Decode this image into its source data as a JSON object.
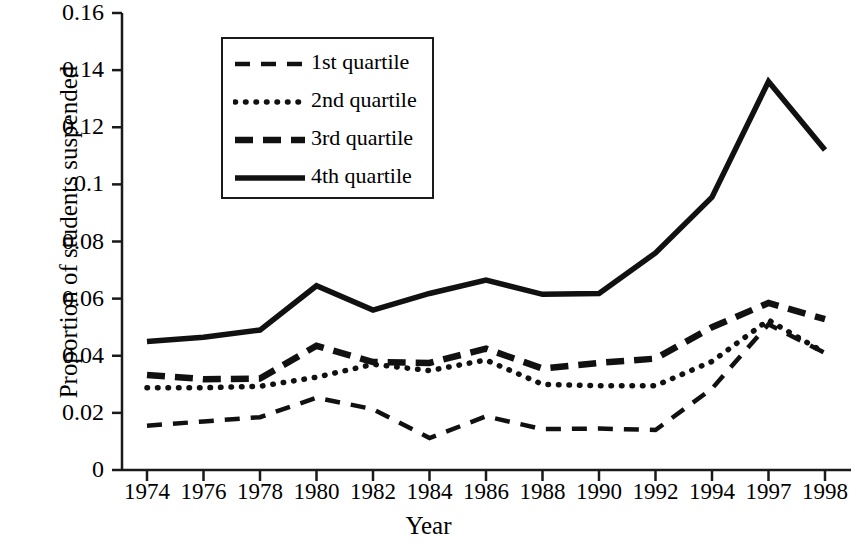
{
  "chart_data": {
    "type": "line",
    "title": "",
    "xlabel": "Year",
    "ylabel": "Proportion of students suspended",
    "categories": [
      "1974",
      "1976",
      "1978",
      "1980",
      "1982",
      "1984",
      "1986",
      "1988",
      "1990",
      "1992",
      "1994",
      "1997",
      "1998"
    ],
    "x_tick_labels": [
      "1974",
      "1976",
      "1978",
      "1980",
      "1982",
      "1984",
      "1986",
      "1988",
      "1990",
      "1992",
      "1994",
      "1997",
      "1998"
    ],
    "y_tick_labels": [
      "0",
      "0.02",
      "0.04",
      "0.06",
      "0.08",
      "0.1",
      "0.12",
      "0.14",
      "0.16"
    ],
    "y_tick_values": [
      0,
      0.02,
      0.04,
      0.06,
      0.08,
      0.1,
      0.12,
      0.14,
      0.16
    ],
    "ylim": [
      0,
      0.16
    ],
    "grid": false,
    "legend_position": "upper-left-inside",
    "series": [
      {
        "name": "1st quartile",
        "style": "dashed-thin",
        "values": [
          0.0155,
          0.017,
          0.0185,
          0.0253,
          0.0213,
          0.0112,
          0.0188,
          0.0143,
          0.0145,
          0.014,
          0.0285,
          0.051,
          0.041
        ]
      },
      {
        "name": "2nd quartile",
        "style": "dotted",
        "values": [
          0.0288,
          0.0288,
          0.0293,
          0.0325,
          0.037,
          0.0348,
          0.0385,
          0.03,
          0.0295,
          0.0295,
          0.038,
          0.0525,
          0.041
        ]
      },
      {
        "name": "3rd quartile",
        "style": "dashed-thick",
        "values": [
          0.0333,
          0.0318,
          0.032,
          0.0435,
          0.0378,
          0.0375,
          0.0425,
          0.0355,
          0.0375,
          0.039,
          0.05,
          0.0585,
          0.0528
        ]
      },
      {
        "name": "4th quartile",
        "style": "solid-thick",
        "values": [
          0.045,
          0.0465,
          0.049,
          0.0645,
          0.056,
          0.0618,
          0.0665,
          0.0615,
          0.0618,
          0.076,
          0.0955,
          0.136,
          0.112
        ]
      }
    ]
  },
  "legend": {
    "entries": [
      {
        "label": "1st quartile"
      },
      {
        "label": "2nd quartile"
      },
      {
        "label": "3rd quartile"
      },
      {
        "label": "4th quartile"
      }
    ]
  },
  "axes": {
    "x_title": "Year",
    "y_title": "Proportion of students suspended"
  }
}
